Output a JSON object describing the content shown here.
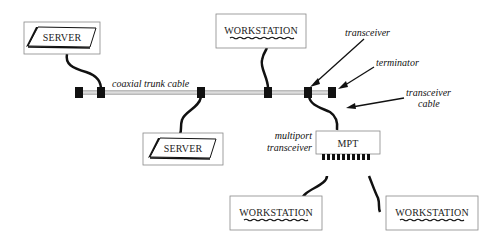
{
  "diagram": {
    "nodes": {
      "server_top": {
        "label": "SERVER"
      },
      "server_bottom": {
        "label": "SERVER"
      },
      "workstation_top": {
        "label": "WORKSTATION"
      },
      "mpt": {
        "label": "MPT"
      },
      "workstation_bottom_left": {
        "label": "WORKSTATION"
      },
      "workstation_bottom_right": {
        "label": "WORKSTATION"
      }
    },
    "labels": {
      "trunk": "coaxial  trunk  cable",
      "transceiver": "transceiver",
      "terminator": "terminator",
      "transceiver_cable_1": "transceiver",
      "transceiver_cable_2": "cable",
      "mpt_1": "multiport",
      "mpt_2": "transceiver"
    },
    "colors": {
      "line": "#111111",
      "box_border": "#888888",
      "trunk": "#999999"
    }
  }
}
